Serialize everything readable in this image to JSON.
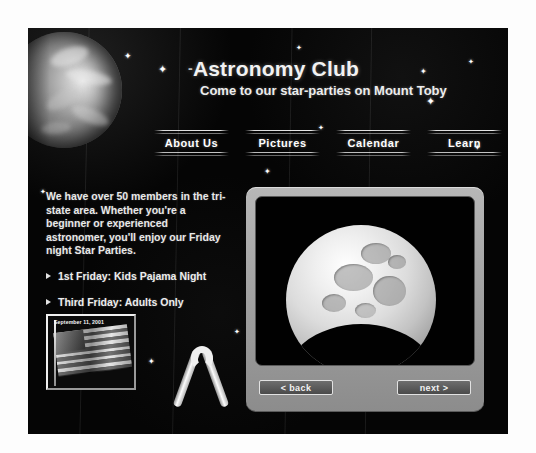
{
  "header": {
    "title": "Astronomy Club",
    "title_lead": "-",
    "tagline": "Come to our star-parties on Mount Toby",
    "planet_alt": "earth-globe"
  },
  "nav": {
    "items": [
      {
        "label": "About Us"
      },
      {
        "label": "Pictures"
      },
      {
        "label": "Calendar"
      },
      {
        "label": "Learn"
      }
    ]
  },
  "main": {
    "intro": "We have over 50 members in the tri-state area. Whether you're a beginner or experienced astronomer, you'll enjoy our Friday night Star Parties.",
    "bullets": [
      {
        "label": "1st Friday: Kids Pajama Night"
      },
      {
        "label": "Third Friday: Adults Only"
      }
    ]
  },
  "memorial": {
    "flag_caption": "September 11, 2001",
    "flag_alt": "american-flag",
    "ribbon_alt": "memorial-ribbon"
  },
  "viewer": {
    "image_alt": "moon-photo",
    "back_label": "< back",
    "next_label": "next >"
  },
  "colors": {
    "page_background": "#050505",
    "text": "#ededed",
    "panel": "#9d9d9d",
    "sheet": "#fdfdfd"
  }
}
